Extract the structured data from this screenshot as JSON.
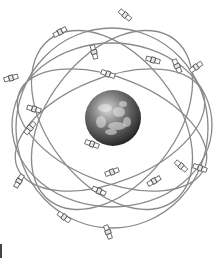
{
  "figure": {
    "colors": {
      "background": "#ffffff",
      "orbit": "#8a8a8a",
      "satellite": "#666666",
      "earth_dark": "#2b2b2b",
      "earth_light": "#bdbdbd"
    },
    "earth": {
      "cx": 113,
      "cy": 118,
      "r": 28
    },
    "orbits": [
      {
        "cx": 110,
        "cy": 130,
        "rx": 100,
        "ry": 52,
        "rot": -22
      },
      {
        "cx": 112,
        "cy": 130,
        "rx": 100,
        "ry": 52,
        "rot": 22
      },
      {
        "cx": 112,
        "cy": 128,
        "rx": 96,
        "ry": 100,
        "rot": 0
      },
      {
        "cx": 112,
        "cy": 120,
        "rx": 102,
        "ry": 64,
        "rot": -52
      },
      {
        "cx": 112,
        "cy": 120,
        "rx": 102,
        "ry": 64,
        "rot": 52
      },
      {
        "cx": 112,
        "cy": 125,
        "rx": 100,
        "ry": 82,
        "rot": 0
      }
    ],
    "satellites": [
      {
        "x": 125,
        "y": 15,
        "a": 40
      },
      {
        "x": 60,
        "y": 32,
        "a": -30
      },
      {
        "x": 94,
        "y": 52,
        "a": 75
      },
      {
        "x": 153,
        "y": 60,
        "a": 15
      },
      {
        "x": 177,
        "y": 66,
        "a": 65
      },
      {
        "x": 196,
        "y": 67,
        "a": -35
      },
      {
        "x": 108,
        "y": 74,
        "a": 20
      },
      {
        "x": 11,
        "y": 78,
        "a": -15
      },
      {
        "x": 34,
        "y": 109,
        "a": 15
      },
      {
        "x": 30,
        "y": 128,
        "a": -50
      },
      {
        "x": 92,
        "y": 144,
        "a": 20
      },
      {
        "x": 112,
        "y": 172,
        "a": -20
      },
      {
        "x": 19,
        "y": 181,
        "a": -60
      },
      {
        "x": 154,
        "y": 181,
        "a": -30
      },
      {
        "x": 181,
        "y": 166,
        "a": 40
      },
      {
        "x": 200,
        "y": 168,
        "a": 20
      },
      {
        "x": 99,
        "y": 191,
        "a": 25
      },
      {
        "x": 64,
        "y": 217,
        "a": 35
      },
      {
        "x": 108,
        "y": 232,
        "a": 70
      }
    ]
  }
}
